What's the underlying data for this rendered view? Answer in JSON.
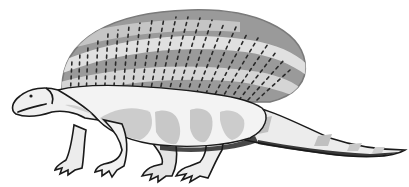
{
  "image": {
    "subject": "sail-backed prehistoric reptile illustration",
    "style": "grayscale cartoon line drawing",
    "background_color": "#ffffff"
  },
  "colors": {
    "outline": "#1a1a1a",
    "sail_dark": "#8c8c8c",
    "sail_mid": "#b0b0b0",
    "sail_light": "#e6e6e6",
    "body_light": "#f2f2f2",
    "body_shade": "#c4c4c4",
    "body_mid": "#d8d8d8"
  }
}
